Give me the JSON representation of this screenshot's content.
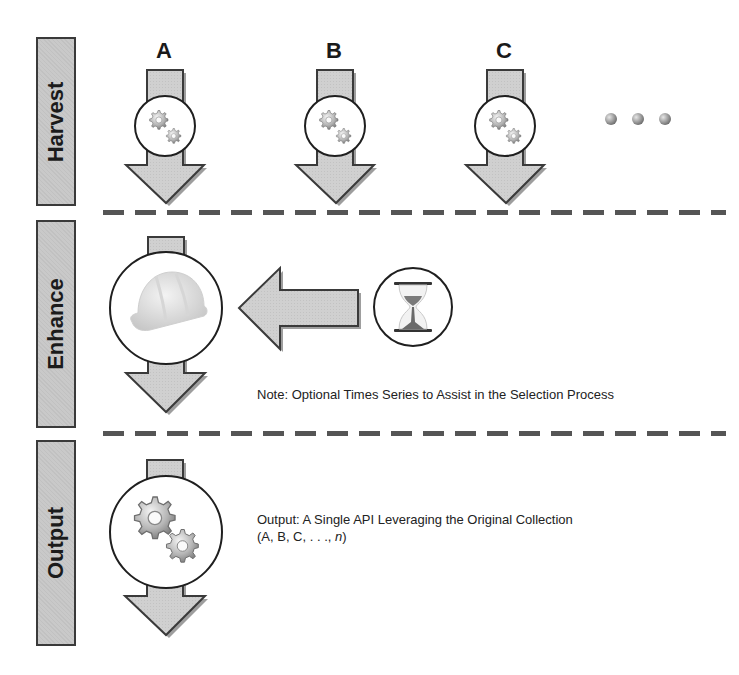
{
  "stages": [
    {
      "id": "harvest",
      "label": "Harvest"
    },
    {
      "id": "enhance",
      "label": "Enhance"
    },
    {
      "id": "output",
      "label": "Output"
    }
  ],
  "harvest": {
    "sources": [
      {
        "letter": "A",
        "icon": "gears-icon"
      },
      {
        "letter": "B",
        "icon": "gears-icon"
      },
      {
        "letter": "C",
        "icon": "gears-icon"
      }
    ],
    "continuation": "ellipsis-dots"
  },
  "enhance": {
    "icon": "hard-hat-icon",
    "input_icon": "hourglass-icon",
    "note": "Note: Optional Times Series to Assist in the Selection Process"
  },
  "output": {
    "icon": "gears-icon",
    "text_line1": "Output: A Single API Leveraging the Original Collection",
    "text_line2_prefix": "(A, B, C, . . ., ",
    "text_line2_italic": "n",
    "text_line2_suffix": ")"
  },
  "colors": {
    "arrow_fill": "#cfcfcf",
    "arrow_stroke": "#3a3a3a",
    "label_fill": "#c9c9c9",
    "dash": "#555555"
  }
}
